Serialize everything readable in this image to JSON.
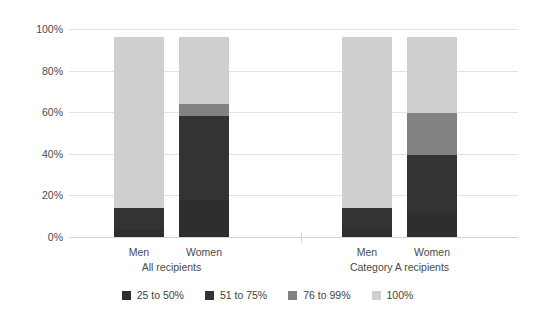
{
  "chart_data": {
    "type": "bar",
    "subtype": "stacked-percent",
    "title": "",
    "xlabel": "",
    "ylabel": "",
    "ylim": [
      0,
      100
    ],
    "ytick_labels": [
      "100%",
      "80%",
      "60%",
      "40%",
      "20%",
      "0%"
    ],
    "ytick_values": [
      100,
      80,
      60,
      40,
      20,
      0
    ],
    "grid": true,
    "legend_position": "bottom",
    "groups": [
      {
        "label": "All recipients",
        "categories": [
          "Men",
          "Women"
        ]
      },
      {
        "label": "Category A recipients",
        "categories": [
          "Men",
          "Women"
        ]
      }
    ],
    "categories": [
      "Men",
      "Women",
      "Men",
      "Women"
    ],
    "series": [
      {
        "name": "25 to 50%",
        "color": "#2e2e2e",
        "values": [
          3.5,
          18.0,
          4.5,
          11.5
        ]
      },
      {
        "name": "51 to 75%",
        "color": "#333333",
        "values": [
          10.5,
          40.0,
          9.5,
          28.0
        ]
      },
      {
        "name": "76 to 99%",
        "color": "#828282",
        "values": [
          0.0,
          6.0,
          0.0,
          20.0
        ]
      },
      {
        "name": "100%",
        "color": "#cfcfcf",
        "values": [
          82.0,
          32.0,
          82.0,
          36.5
        ]
      }
    ]
  },
  "axis": {
    "ticks": [
      {
        "label": "100%",
        "value": 100
      },
      {
        "label": "80%",
        "value": 80
      },
      {
        "label": "60%",
        "value": 60
      },
      {
        "label": "40%",
        "value": 40
      },
      {
        "label": "20%",
        "value": 20
      },
      {
        "label": "0%",
        "value": 0
      }
    ]
  },
  "xaxis": {
    "bar_labels": [
      "Men",
      "Women",
      "Men",
      "Women"
    ],
    "group_labels": [
      "All recipients",
      "Category A recipients"
    ]
  },
  "legend": {
    "items": [
      {
        "label": "25 to 50%",
        "color": "#2e2e2e"
      },
      {
        "label": "51 to 75%",
        "color": "#333333"
      },
      {
        "label": "76 to 99%",
        "color": "#828282"
      },
      {
        "label": "100%",
        "color": "#cfcfcf"
      }
    ]
  },
  "colors": {
    "background": "#ffffff",
    "gridline": "#e3e3e3",
    "baseline": "#d5d5d5",
    "text": "#3f3f3f"
  }
}
